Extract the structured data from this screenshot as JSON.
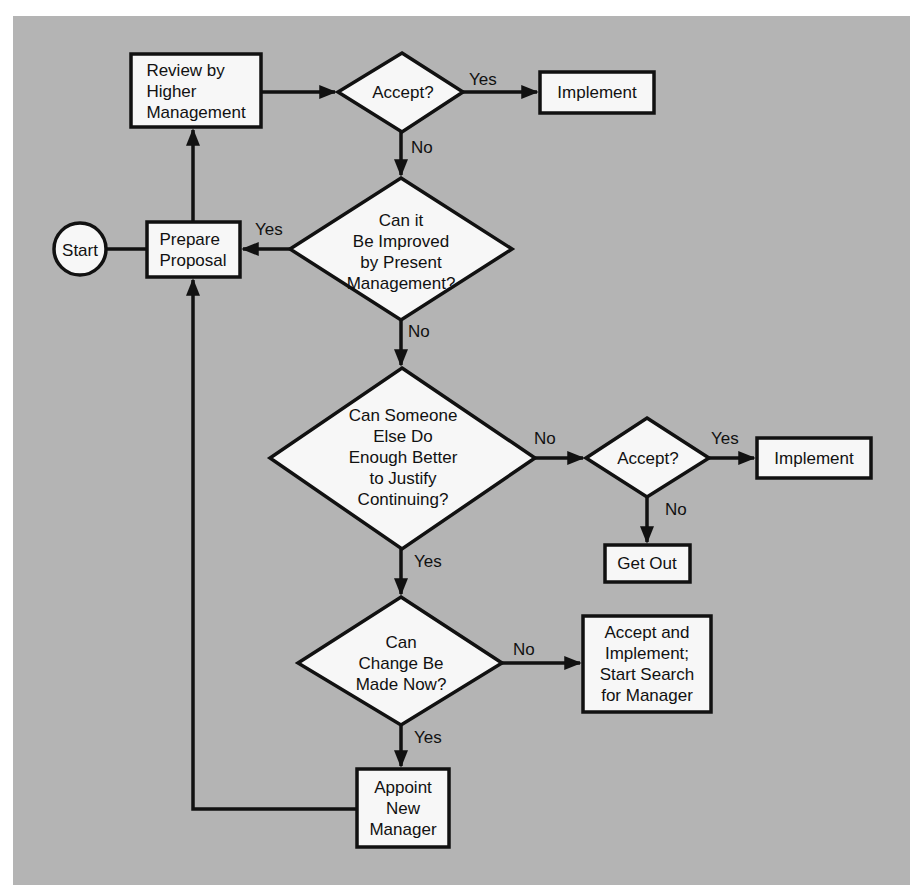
{
  "diagram": {
    "type": "flowchart",
    "colors": {
      "background": "#b4b4b4",
      "node_fill": "#f7f7f7",
      "stroke": "#111111"
    },
    "nodes": [
      {
        "id": "start",
        "shape": "circle",
        "label": "Start"
      },
      {
        "id": "prepare",
        "shape": "rect",
        "label": "Prepare\nProposal"
      },
      {
        "id": "review",
        "shape": "rect",
        "label": "Review by\nHigher\nManagement"
      },
      {
        "id": "accept1",
        "shape": "diamond",
        "label": "Accept?"
      },
      {
        "id": "implement1",
        "shape": "rect",
        "label": "Implement"
      },
      {
        "id": "improve",
        "shape": "diamond",
        "label": "Can it\nBe Improved\nby Present\nManagement?"
      },
      {
        "id": "someone",
        "shape": "diamond",
        "label": "Can Someone\nElse Do\nEnough Better\nto Justify\nContinuing?"
      },
      {
        "id": "accept2",
        "shape": "diamond",
        "label": "Accept?"
      },
      {
        "id": "implement2",
        "shape": "rect",
        "label": "Implement"
      },
      {
        "id": "getout",
        "shape": "rect",
        "label": "Get Out"
      },
      {
        "id": "change",
        "shape": "diamond",
        "label": "Can\nChange Be\nMade Now?"
      },
      {
        "id": "acceptsearch",
        "shape": "rect",
        "label": "Accept and\nImplement;\nStart Search\nfor Manager"
      },
      {
        "id": "appoint",
        "shape": "rect",
        "label": "Appoint\nNew\nManager"
      }
    ],
    "edges": [
      {
        "from": "start",
        "to": "prepare",
        "label": ""
      },
      {
        "from": "prepare",
        "to": "review",
        "label": ""
      },
      {
        "from": "review",
        "to": "accept1",
        "label": ""
      },
      {
        "from": "accept1",
        "to": "implement1",
        "label": "Yes"
      },
      {
        "from": "accept1",
        "to": "improve",
        "label": "No"
      },
      {
        "from": "improve",
        "to": "prepare",
        "label": "Yes"
      },
      {
        "from": "improve",
        "to": "someone",
        "label": "No"
      },
      {
        "from": "someone",
        "to": "accept2",
        "label": "No"
      },
      {
        "from": "accept2",
        "to": "implement2",
        "label": "Yes"
      },
      {
        "from": "accept2",
        "to": "getout",
        "label": "No"
      },
      {
        "from": "someone",
        "to": "change",
        "label": "Yes"
      },
      {
        "from": "change",
        "to": "acceptsearch",
        "label": "No"
      },
      {
        "from": "change",
        "to": "appoint",
        "label": "Yes"
      },
      {
        "from": "appoint",
        "to": "prepare",
        "label": ""
      }
    ]
  }
}
